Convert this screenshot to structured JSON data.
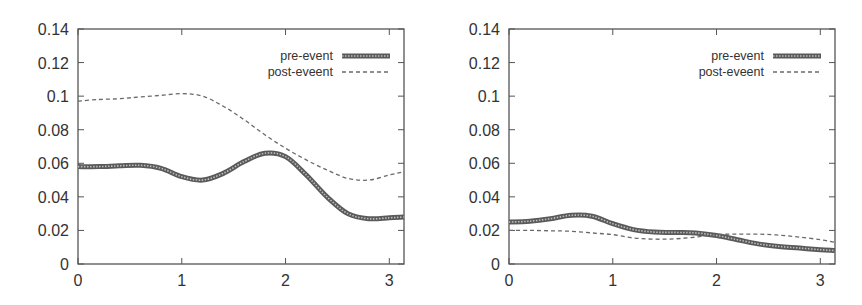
{
  "chart_data": [
    {
      "type": "line",
      "title": "",
      "xlabel": "",
      "ylabel": "",
      "xlim": [
        0,
        3.14159
      ],
      "ylim": [
        0,
        0.14
      ],
      "grid": false,
      "legend_position": "top-right",
      "x_ticks": [
        0,
        1,
        2,
        3
      ],
      "x_tick_labels": [
        "0",
        "1",
        "2",
        "3"
      ],
      "y_ticks": [
        0,
        0.02,
        0.04,
        0.06,
        0.08,
        0.1,
        0.12,
        0.14
      ],
      "y_tick_labels": [
        "0",
        "0.02",
        "0.04",
        "0.06",
        "0.08",
        "0.1",
        "0.12",
        "0.14"
      ],
      "x": [
        0,
        0.2,
        0.4,
        0.6,
        0.8,
        1.0,
        1.2,
        1.4,
        1.6,
        1.8,
        2.0,
        2.2,
        2.4,
        2.6,
        2.8,
        3.0,
        3.14
      ],
      "series": [
        {
          "name": "pre-event",
          "style": "thick-solid",
          "values": [
            0.058,
            0.058,
            0.0585,
            0.0588,
            0.057,
            0.052,
            0.05,
            0.054,
            0.061,
            0.066,
            0.064,
            0.053,
            0.04,
            0.03,
            0.027,
            0.0275,
            0.028
          ]
        },
        {
          "name": "post-eveent",
          "style": "dashed",
          "values": [
            0.097,
            0.098,
            0.0985,
            0.0995,
            0.1005,
            0.1015,
            0.1,
            0.094,
            0.086,
            0.077,
            0.069,
            0.062,
            0.056,
            0.051,
            0.05,
            0.053,
            0.055
          ]
        }
      ]
    },
    {
      "type": "line",
      "title": "",
      "xlabel": "",
      "ylabel": "",
      "xlim": [
        0,
        3.14159
      ],
      "ylim": [
        0,
        0.14
      ],
      "grid": false,
      "legend_position": "top-right",
      "x_ticks": [
        0,
        1,
        2,
        3
      ],
      "x_tick_labels": [
        "0",
        "1",
        "2",
        "3"
      ],
      "y_ticks": [
        0,
        0.02,
        0.04,
        0.06,
        0.08,
        0.1,
        0.12,
        0.14
      ],
      "y_tick_labels": [
        "0",
        "0.02",
        "0.04",
        "0.06",
        "0.08",
        "0.1",
        "0.12",
        "0.14"
      ],
      "x": [
        0,
        0.2,
        0.4,
        0.6,
        0.8,
        1.0,
        1.2,
        1.4,
        1.6,
        1.8,
        2.0,
        2.2,
        2.4,
        2.6,
        2.8,
        3.0,
        3.14
      ],
      "series": [
        {
          "name": "pre-event",
          "style": "thick-solid",
          "values": [
            0.025,
            0.0255,
            0.027,
            0.029,
            0.0285,
            0.024,
            0.0205,
            0.019,
            0.0188,
            0.0185,
            0.017,
            0.0145,
            0.012,
            0.0105,
            0.0095,
            0.0085,
            0.008
          ]
        },
        {
          "name": "post-eveent",
          "style": "dashed",
          "values": [
            0.02,
            0.02,
            0.0198,
            0.0195,
            0.0185,
            0.0175,
            0.0155,
            0.0148,
            0.015,
            0.016,
            0.0175,
            0.0178,
            0.0178,
            0.0172,
            0.016,
            0.0145,
            0.013
          ]
        }
      ]
    }
  ],
  "colors": {
    "axis": "#555555",
    "pre_event": "#5a5a5a",
    "post_event": "#6a6a6a",
    "text": "#333333"
  }
}
